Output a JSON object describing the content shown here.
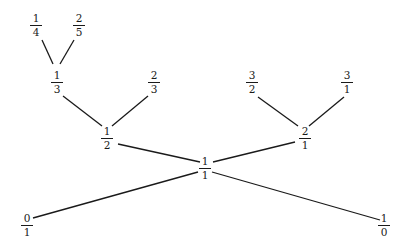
{
  "diagram": {
    "type": "tree",
    "nodes": [
      {
        "id": "n0_1",
        "num": "0",
        "den": "1",
        "x": 27,
        "y": 213
      },
      {
        "id": "n1_0",
        "num": "1",
        "den": "0",
        "x": 384,
        "y": 213
      },
      {
        "id": "n1_1",
        "num": "1",
        "den": "1",
        "x": 205,
        "y": 156
      },
      {
        "id": "n1_2",
        "num": "1",
        "den": "2",
        "x": 107,
        "y": 126
      },
      {
        "id": "n2_1",
        "num": "2",
        "den": "1",
        "x": 305,
        "y": 126
      },
      {
        "id": "n1_3",
        "num": "1",
        "den": "3",
        "x": 57,
        "y": 70
      },
      {
        "id": "n2_3",
        "num": "2",
        "den": "3",
        "x": 154,
        "y": 70
      },
      {
        "id": "n3_2",
        "num": "3",
        "den": "2",
        "x": 252,
        "y": 70
      },
      {
        "id": "n3_1",
        "num": "3",
        "den": "1",
        "x": 347,
        "y": 70
      },
      {
        "id": "n1_4",
        "num": "1",
        "den": "4",
        "x": 36,
        "y": 13
      },
      {
        "id": "n2_5",
        "num": "2",
        "den": "5",
        "x": 79,
        "y": 13
      }
    ],
    "edges": [
      {
        "from": "n1_1",
        "to": "n0_1",
        "x1": 198,
        "y1": 172,
        "x2": 33,
        "y2": 218
      },
      {
        "from": "n1_1",
        "to": "n1_0",
        "x1": 212,
        "y1": 172,
        "x2": 380,
        "y2": 220
      },
      {
        "from": "n1_1",
        "to": "n1_2",
        "x1": 200,
        "y1": 162,
        "x2": 118,
        "y2": 144
      },
      {
        "from": "n1_1",
        "to": "n2_1",
        "x1": 213,
        "y1": 162,
        "x2": 295,
        "y2": 142
      },
      {
        "from": "n1_2",
        "to": "n1_3",
        "x1": 102,
        "y1": 126,
        "x2": 63,
        "y2": 96
      },
      {
        "from": "n1_2",
        "to": "n2_3",
        "x1": 112,
        "y1": 126,
        "x2": 148,
        "y2": 96
      },
      {
        "from": "n2_1",
        "to": "n3_2",
        "x1": 298,
        "y1": 126,
        "x2": 258,
        "y2": 97
      },
      {
        "from": "n2_1",
        "to": "n3_1",
        "x1": 309,
        "y1": 126,
        "x2": 344,
        "y2": 97
      },
      {
        "from": "n1_3",
        "to": "n1_4",
        "x1": 53,
        "y1": 64,
        "x2": 42,
        "y2": 40
      },
      {
        "from": "n1_3",
        "to": "n2_5",
        "x1": 60,
        "y1": 64,
        "x2": 74,
        "y2": 40
      }
    ]
  }
}
